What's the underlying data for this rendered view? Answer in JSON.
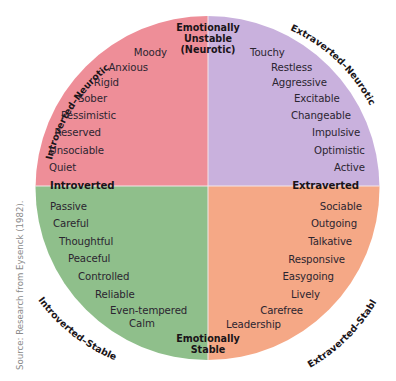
{
  "colors": {
    "introverted_neurotic": "#EE8E98",
    "extraverted_neurotic": "#C9B1DD",
    "introverted_stable": "#8FBF8B",
    "extraverted_stable": "#F5A886",
    "divider": "#F4E6EA",
    "text": "#2b2530",
    "source_text": "#8a8a8a"
  },
  "axes": {
    "top": [
      "Emotionally",
      "Unstable",
      "(Neurotic)"
    ],
    "bottom": [
      "Emotionally",
      "Stable"
    ],
    "left": "Introverted",
    "right": "Extraverted"
  },
  "quadrant_labels": {
    "top_left": "Introverted–Neurotic",
    "top_right": "Extraverted–Neurotic",
    "bottom_left": "Introverted–Stable",
    "bottom_right": "Extraverted–Stable"
  },
  "quadrants": {
    "introverted_neurotic": [
      "Moody",
      "Anxious",
      "Rigid",
      "Sober",
      "Pessimistic",
      "Reserved",
      "Unsociable",
      "Quiet"
    ],
    "extraverted_neurotic": [
      "Touchy",
      "Restless",
      "Aggressive",
      "Excitable",
      "Changeable",
      "Impulsive",
      "Optimistic",
      "Active"
    ],
    "introverted_stable": [
      "Passive",
      "Careful",
      "Thoughtful",
      "Peaceful",
      "Controlled",
      "Reliable",
      "Even-tempered",
      "Calm"
    ],
    "extraverted_stable": [
      "Sociable",
      "Outgoing",
      "Talkative",
      "Responsive",
      "Easygoing",
      "Lively",
      "Carefree",
      "Leadership"
    ]
  },
  "source": "Source: Research from Eysenck (1982)."
}
